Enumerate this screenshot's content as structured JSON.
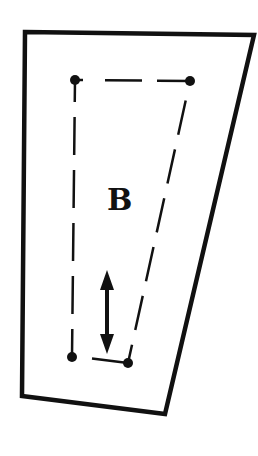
{
  "diagram": {
    "type": "pattern-piece",
    "label": "B",
    "colors": {
      "stroke": "#111111",
      "background": "#ffffff"
    },
    "outer_shape": {
      "description": "solid outline quadrilateral (trapezoid tapering downward to the right)",
      "points": [
        [
          25,
          32
        ],
        [
          254,
          35
        ],
        [
          165,
          414
        ],
        [
          22,
          396
        ]
      ]
    },
    "inner_shape": {
      "description": "dashed quadrilateral with dot markers at corners",
      "points": [
        [
          75,
          80
        ],
        [
          190,
          81
        ],
        [
          128,
          363
        ],
        [
          72,
          357
        ]
      ],
      "dash_pattern": "35 15"
    },
    "grainline_arrow": {
      "description": "double-headed vertical arrow (grainline)",
      "x": 107,
      "y1": 272,
      "y2": 353
    }
  }
}
